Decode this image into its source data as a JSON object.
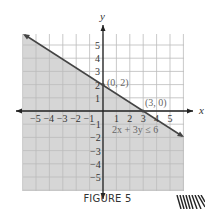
{
  "caption": "FIGURE 5",
  "chart_data": {
    "type": "line",
    "title": "",
    "xlabel": "x",
    "ylabel": "y",
    "xlim": [
      -6,
      6
    ],
    "ylim": [
      -6,
      6
    ],
    "x_ticks": [
      "-5",
      "-4",
      "-3",
      "-2",
      "-1",
      "1",
      "2",
      "3",
      "4",
      "5"
    ],
    "y_ticks": [
      "5",
      "4",
      "3",
      "2",
      "1",
      "-1",
      "-2",
      "-3",
      "-4",
      "-5"
    ],
    "grid": true,
    "series": [
      {
        "name": "2x + 3y = 6",
        "x": [
          -6,
          6
        ],
        "y": [
          6,
          -2
        ],
        "style": "solid boundary line with arrows"
      }
    ],
    "shaded_region": "2x + 3y ≤ 6 (below the line)",
    "annotations": [
      {
        "label": "(0, 2)",
        "x": 0,
        "y": 2
      },
      {
        "label": "(3, 0)",
        "x": 3,
        "y": 0
      },
      {
        "label": "2x + 3y ≤ 6",
        "x": 3.2,
        "y": -1.3
      }
    ],
    "colors": {
      "shade": "#d9d9d9",
      "grid": "#bdbdbd",
      "axis": "#222222",
      "line": "#444444"
    }
  },
  "labels": {
    "x_axis": "x",
    "y_axis": "y",
    "point_a": "(0, 2)",
    "point_b": "(3, 0)",
    "inequality": "2x + 3y ≤ 6"
  }
}
